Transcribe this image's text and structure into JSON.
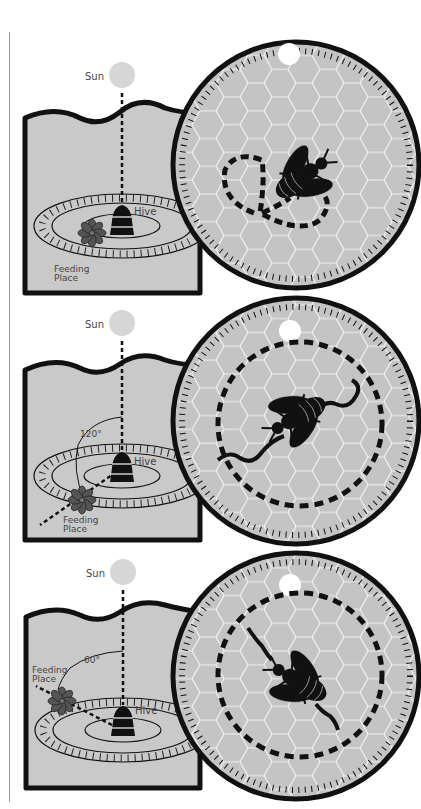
{
  "figure": {
    "colors": {
      "ground": "#c9c9c9",
      "outline": "#111111",
      "sun": "#d6d6d6",
      "comb": "#c4c4c4",
      "comb_lines": "#f2f2f2",
      "flower": "#555555",
      "label": "#444444"
    }
  },
  "panels": [
    {
      "sun_label": "Sun",
      "hive_label": "Hive",
      "feeding_label_line1": "Feeding",
      "feeding_label_line2": "Place",
      "angle_label": "",
      "dance": "round/figure-eight dance, food near hive"
    },
    {
      "sun_label": "Sun",
      "hive_label": "Hive",
      "feeding_label_line1": "Feeding",
      "feeding_label_line2": "Place",
      "angle_label": "120°",
      "dance": "waggle run at 120° from vertical"
    },
    {
      "sun_label": "Sun",
      "hive_label": "Hive",
      "feeding_label_line1": "Feeding",
      "feeding_label_line2": "Place",
      "angle_label": "60°",
      "dance": "waggle run at 60° from vertical (to the left)"
    }
  ]
}
